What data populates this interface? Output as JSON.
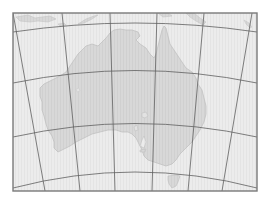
{
  "map": {
    "region": "Australia",
    "projection": "conic",
    "colors": {
      "background": "#ffffff",
      "ocean": "#ececec",
      "land": "#d6d6d6",
      "coastline": "#bdbdbd",
      "graticule": "#5f5f5f",
      "frame": "#7a7a7a"
    },
    "frame": {
      "x": 13,
      "y": 13,
      "width": 244,
      "height": 178
    },
    "meridians": [
      {
        "top_x": 13,
        "bottom_x": 45
      },
      {
        "top_x": 62,
        "bottom_x": 80
      },
      {
        "top_x": 110,
        "bottom_x": 115
      },
      {
        "top_x": 157,
        "bottom_x": 152
      },
      {
        "top_x": 204,
        "bottom_x": 188
      },
      {
        "top_x": 252,
        "bottom_x": 222
      }
    ],
    "parallels": [
      {
        "edge_y": 32,
        "center_y": 24
      },
      {
        "edge_y": 83,
        "center_y": 71
      },
      {
        "edge_y": 137,
        "center_y": 124
      },
      {
        "edge_y": 186,
        "center_y": 172
      }
    ],
    "features": [
      "australia-mainland",
      "tasmania",
      "new-guinea",
      "indonesian-islands",
      "lake-eyre",
      "spencer-gulf"
    ]
  }
}
